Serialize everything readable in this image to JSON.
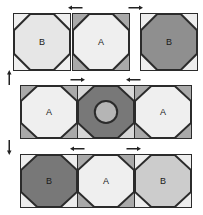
{
  "figure": {
    "title": "",
    "type": "tiling-diagram",
    "background": "#ffffff",
    "outline_color": "#2b2b2b"
  },
  "palette": {
    "very_light": "#ededed",
    "light": "#e3e3e3",
    "light2": "#d7d7d7",
    "mid_light": "#c9c9c9",
    "mid": "#a9a9a9",
    "mid_dark": "#8f8f8f",
    "dark": "#707070",
    "outline": "#2b2b2b",
    "text": "#1a1a1a"
  },
  "rows": [
    {
      "id": "row-top",
      "contiguous": false,
      "tiles": [
        {
          "label": "B",
          "octagon_color": "#e6e6e6",
          "corner_color": "#efefef",
          "has_circle": false,
          "circle_color": ""
        },
        {
          "label": "A",
          "octagon_color": "#efefef",
          "corner_color": "#a9a9a9",
          "has_circle": false,
          "circle_color": ""
        },
        {
          "label": "B",
          "octagon_color": "#8f8f8f",
          "corner_color": "#ededed",
          "has_circle": false,
          "circle_color": ""
        }
      ],
      "arrows": [
        {
          "direction": "left"
        },
        {
          "direction": "right"
        }
      ]
    },
    {
      "id": "row-middle",
      "contiguous": true,
      "tiles": [
        {
          "label": "A",
          "octagon_color": "#efefef",
          "corner_color": "#a9a9a9",
          "has_circle": false,
          "circle_color": ""
        },
        {
          "label": "",
          "octagon_color": "#787878",
          "corner_color": "#d7d7d7",
          "has_circle": true,
          "circle_color": "#b5b5b5"
        },
        {
          "label": "A",
          "octagon_color": "#efefef",
          "corner_color": "#a9a9a9",
          "has_circle": false,
          "circle_color": ""
        }
      ],
      "arrows": [
        {
          "direction": "right"
        },
        {
          "direction": "left"
        }
      ]
    },
    {
      "id": "row-bottom",
      "contiguous": true,
      "tiles": [
        {
          "label": "B",
          "octagon_color": "#787878",
          "corner_color": "#ededed",
          "has_circle": false,
          "circle_color": ""
        },
        {
          "label": "A",
          "octagon_color": "#efefef",
          "corner_color": "#a9a9a9",
          "has_circle": false,
          "circle_color": ""
        },
        {
          "label": "B",
          "octagon_color": "#cccccc",
          "corner_color": "#ededed",
          "has_circle": false,
          "circle_color": ""
        }
      ],
      "arrows": [
        {
          "direction": "left"
        },
        {
          "direction": "right"
        }
      ]
    }
  ],
  "side_arrows": [
    {
      "id": "side-arrow-up",
      "direction": "up"
    },
    {
      "id": "side-arrow-down",
      "direction": "down"
    }
  ]
}
